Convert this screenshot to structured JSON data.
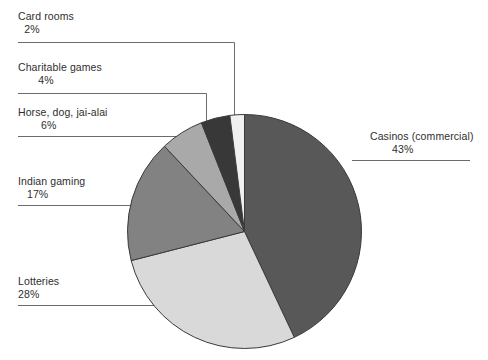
{
  "chart_data": {
    "type": "pie",
    "title": "",
    "categories": [
      "Casinos (commercial)",
      "Lotteries",
      "Indian gaming",
      "Horse, dog, jai-alai",
      "Charitable games",
      "Card rooms"
    ],
    "values": [
      43,
      28,
      17,
      6,
      4,
      2
    ],
    "value_suffix": "%",
    "start_angle_deg": 0,
    "direction": "clockwise",
    "legend": "callout-labels",
    "grid": false,
    "slices": [
      {
        "label": "Casinos (commercial)",
        "percent": 43,
        "percent_text": "43%",
        "color": "#585858"
      },
      {
        "label": "Lotteries",
        "percent": 28,
        "percent_text": "28%",
        "color": "#d9d9d9"
      },
      {
        "label": "Indian gaming",
        "percent": 17,
        "percent_text": "17%",
        "color": "#828282"
      },
      {
        "label": "Horse, dog, jai-alai",
        "percent": 6,
        "percent_text": "6%",
        "color": "#a9a9a9"
      },
      {
        "label": "Charitable games",
        "percent": 4,
        "percent_text": "4%",
        "color": "#383838"
      },
      {
        "label": "Card rooms",
        "percent": 2,
        "percent_text": "2%",
        "color": "#f0f0f0"
      }
    ]
  },
  "labels": {
    "card_rooms": {
      "name": "Card rooms",
      "pct": "2%"
    },
    "charitable": {
      "name": "Charitable games",
      "pct": "4%"
    },
    "horse": {
      "name": "Horse, dog, jai-alai",
      "pct": "6%"
    },
    "indian": {
      "name": "Indian gaming",
      "pct": "17%"
    },
    "lotteries": {
      "name": "Lotteries",
      "pct": "28%"
    },
    "casinos": {
      "name": "Casinos (commercial)",
      "pct": "43%"
    }
  },
  "colors": {
    "background": "#ffffff",
    "outline": "#3a3a3a",
    "leader_line": "#6b6b6b",
    "text": "#2e2e2e"
  }
}
